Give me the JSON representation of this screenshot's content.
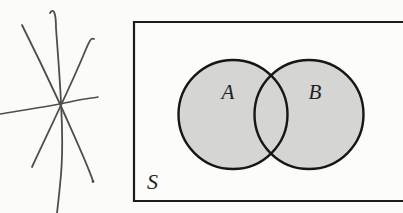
{
  "figure": {
    "colors": {
      "background": "#fbfbf9",
      "rect_fill": "#fcfcfa",
      "rect_stroke": "#1c1c1c",
      "circle_fill": "#d5d5d3",
      "circle_stroke": "#161616",
      "scribble": "#4e4e4e",
      "label": "#1f1f1f"
    },
    "venn": {
      "sample_space": {
        "label": "S",
        "label_x": 147,
        "label_y": 189,
        "label_font_size": 22,
        "rect_left": 134,
        "rect_top": 22,
        "rect_bottom": 201,
        "rect_right": 404,
        "stroke_width": 2.2
      },
      "sets": [
        {
          "label": "A",
          "cx": 233,
          "cy": 114.5,
          "r": 54.5,
          "label_x": 228,
          "label_y": 99,
          "label_font_size": 21
        },
        {
          "label": "B",
          "cx": 309,
          "cy": 114.5,
          "r": 54.5,
          "label_x": 315,
          "label_y": 99,
          "label_font_size": 21
        }
      ],
      "outline_width": 2.4
    },
    "scribble": {
      "strokes": [
        {
          "name": "vertical-stroke",
          "d": "M50,13 C53,8 56,11 56,28 C58,55 60,80 61,103 C63,138 62,168 60,185 C59,196 58,204 57,213",
          "width": 1.8
        },
        {
          "name": "diagonal-nw-se-stroke",
          "d": "M22,25 C34,49 48,78 60,104 C71,129 87,163 93,181",
          "width": 1.8
        },
        {
          "name": "diagonal-ne-sw-stroke",
          "d": "M94,39 C91,37 89,42 86,49 C74,79 52,124 32,167",
          "width": 1.8
        },
        {
          "name": "horizontal-stroke",
          "d": "M0,114 C24,110 52,106 74,101 C83,99 92,98 98,97",
          "width": 1.6
        }
      ],
      "end_dot": {
        "cx": 93,
        "cy": 181.5,
        "r": 1.4
      }
    }
  }
}
